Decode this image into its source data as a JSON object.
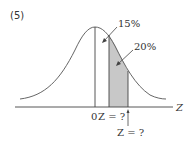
{
  "problem_label": "(5)",
  "annotations": {
    "upper_area": "15%",
    "shaded_area": "20%",
    "origin": "0",
    "z_first": "Z = ?",
    "z_second": "Z = ?",
    "axis": "Z"
  },
  "colors": {
    "curve": "#555555",
    "shade": "#c8c8c8",
    "axis": "#444444"
  }
}
